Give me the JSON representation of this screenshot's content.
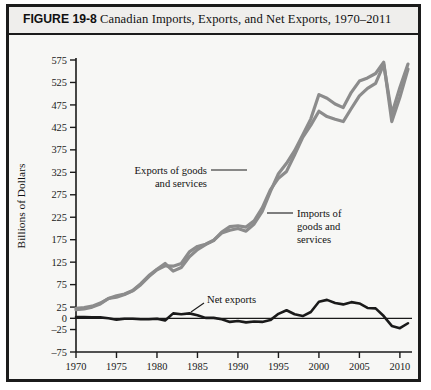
{
  "figure": {
    "number": "FIGURE 19-8",
    "title": "Canadian Imports, Exports, and Net Exports, 1970–2011",
    "border_color": "#1b1b1b",
    "header_bg": "#efeeec",
    "plot_bg": "#f7f7f5"
  },
  "annotations": {
    "exports_line1": "Exports of goods",
    "exports_line2": "and services",
    "imports_line1": "Imports of",
    "imports_line2": "goods and",
    "imports_line3": "services",
    "net_exports": "Net exports"
  },
  "chart_data": {
    "type": "line",
    "title": "Canadian Imports, Exports, and Net Exports, 1970–2011",
    "xlabel": "Year",
    "ylabel": "Billions  of  Dollars",
    "xlim": [
      1970,
      2011
    ],
    "ylim": [
      -75,
      575
    ],
    "grid": false,
    "legend": "inline-annotations",
    "x_ticks": [
      1970,
      1975,
      1980,
      1985,
      1990,
      1995,
      2000,
      2005,
      2010
    ],
    "y_ticks": [
      -75,
      -25,
      0,
      25,
      75,
      125,
      175,
      225,
      275,
      325,
      375,
      425,
      475,
      525,
      575
    ],
    "x": [
      1970,
      1971,
      1972,
      1973,
      1974,
      1975,
      1976,
      1977,
      1978,
      1979,
      1980,
      1981,
      1982,
      1983,
      1984,
      1985,
      1986,
      1987,
      1988,
      1989,
      1990,
      1991,
      1992,
      1993,
      1994,
      1995,
      1996,
      1997,
      1998,
      1999,
      2000,
      2001,
      2002,
      2003,
      2004,
      2005,
      2006,
      2007,
      2008,
      2009,
      2010,
      2011
    ],
    "series": [
      {
        "name": "Exports of goods and services",
        "color": "#8c8c8c",
        "width": 3.2,
        "values": [
          22,
          24,
          27,
          34,
          44,
          47,
          53,
          61,
          75,
          93,
          108,
          117,
          116,
          122,
          148,
          160,
          165,
          174,
          190,
          196,
          200,
          194,
          210,
          238,
          282,
          322,
          345,
          373,
          408,
          444,
          498,
          490,
          477,
          469,
          503,
          528,
          535,
          545,
          570,
          438,
          492,
          555
        ],
        "label_x": 1986,
        "label_y": 300
      },
      {
        "name": "Imports of goods and services",
        "color": "#8c8c8c",
        "width": 3.2,
        "values": [
          19,
          21,
          25,
          32,
          44,
          50,
          54,
          62,
          77,
          95,
          109,
          122,
          105,
          113,
          137,
          153,
          164,
          173,
          192,
          204,
          206,
          203,
          217,
          246,
          286,
          312,
          327,
          364,
          403,
          430,
          461,
          449,
          443,
          438,
          467,
          495,
          512,
          523,
          565,
          455,
          514,
          566
        ],
        "label_x": 2001,
        "label_y": 290
      },
      {
        "name": "Net exports",
        "color": "#1a1a1a",
        "width": 2.6,
        "values": [
          3,
          3,
          2,
          2,
          0,
          -3,
          -1,
          -1,
          -2,
          -2,
          -1,
          -5,
          11,
          9,
          11,
          7,
          1,
          1,
          -2,
          -8,
          -6,
          -9,
          -7,
          -8,
          -4,
          10,
          18,
          9,
          5,
          14,
          37,
          41,
          34,
          31,
          36,
          33,
          23,
          22,
          5,
          -17,
          -22,
          -11
        ],
        "label_x": 1995,
        "label_y": 45
      }
    ]
  }
}
